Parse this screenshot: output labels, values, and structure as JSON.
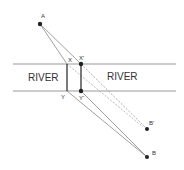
{
  "diagram": {
    "labels": {
      "river_left": "RIVER",
      "river_right": "RIVER",
      "A": "A",
      "B": "B",
      "B_prime": "B'",
      "X": "X",
      "X_prime": "X'",
      "Y": "Y",
      "Y_prime": "Y'"
    },
    "points": {
      "A": [
        40,
        24
      ],
      "B": [
        147,
        157
      ],
      "B_prime": [
        147,
        129
      ],
      "X": [
        67,
        64
      ],
      "X_prime": [
        81,
        64
      ],
      "Y": [
        67,
        91
      ],
      "Y_prime": [
        81,
        91
      ]
    },
    "river_banks": {
      "top_y": 64,
      "bottom_y": 91,
      "x_start": 13,
      "x_end": 176
    },
    "colors": {
      "line": "#888888",
      "bridge": "#333333",
      "point": "#222222"
    }
  }
}
